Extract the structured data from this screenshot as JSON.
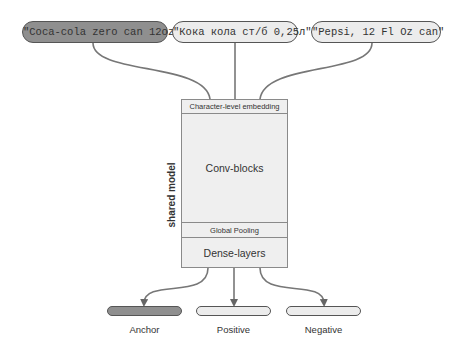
{
  "diagram": {
    "inputs": [
      {
        "text": "\"Coca-cola zero can 12oz\"",
        "style": "dark"
      },
      {
        "text": "\"Кока кола ст/б 0,25л\"",
        "style": "light"
      },
      {
        "text": "\"Pepsi, 12 Fl Oz can\"",
        "style": "light"
      }
    ],
    "model": {
      "side_label": "shared model",
      "layers": [
        "Character-level embedding",
        "Conv-blocks",
        "Global Pooling",
        "Dense-layers"
      ]
    },
    "outputs": [
      {
        "label": "Anchor",
        "style": "dark"
      },
      {
        "label": "Positive",
        "style": "light"
      },
      {
        "label": "Negative",
        "style": "light"
      }
    ],
    "colors": {
      "dark_fill": "#8f8f8f",
      "light_fill": "#ececec",
      "box_fill": "#efefef",
      "line": "#666666"
    }
  }
}
